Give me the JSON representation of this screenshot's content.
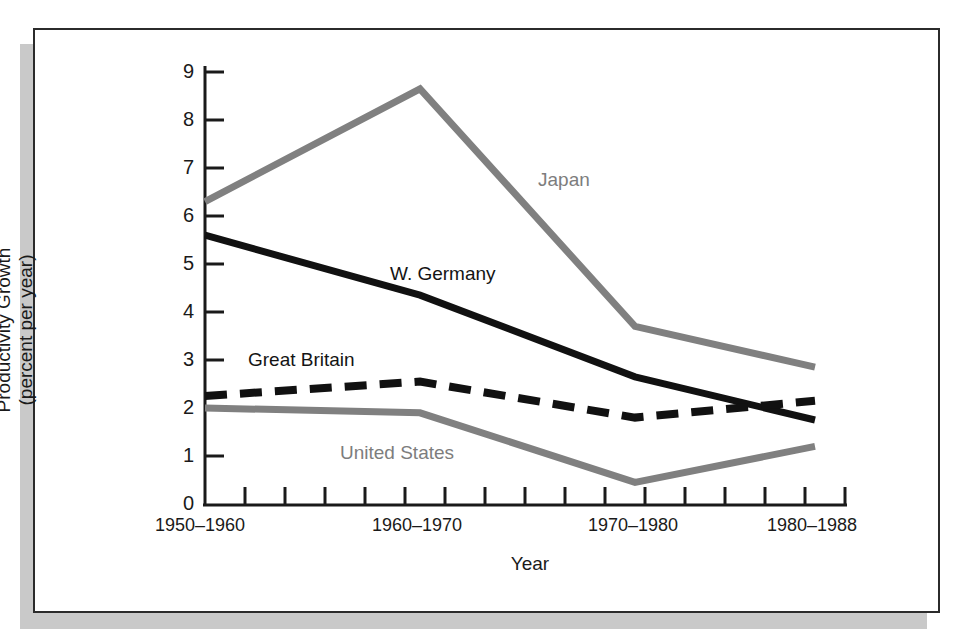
{
  "figure": {
    "frame_border_color": "#2b2b2b",
    "shadow_color": "#c9c9c9",
    "background": "#ffffff"
  },
  "chart_data": {
    "type": "line",
    "title": "",
    "xlabel": "Year",
    "ylabel": "Productivity Growth\n(percent per year)",
    "categories": [
      "1950–1960",
      "1960–1970",
      "1970–1980",
      "1980–1988"
    ],
    "ylim": [
      0,
      9
    ],
    "yticks": [
      0,
      1,
      2,
      3,
      4,
      5,
      6,
      7,
      8,
      9
    ],
    "ytick_labels": [
      "0",
      "1",
      "2",
      "3",
      "4",
      "5",
      "6",
      "7",
      "8",
      "9"
    ],
    "grid": false,
    "legend_position": "inline-annotations",
    "minor_xticks": 16,
    "series": [
      {
        "name": "Japan",
        "values": [
          6.3,
          8.65,
          3.7,
          2.85
        ],
        "color": "#808080",
        "style": "solid",
        "label_color": "#7d7d7d"
      },
      {
        "name": "W. Germany",
        "values": [
          5.6,
          4.35,
          2.65,
          1.75
        ],
        "color": "#111111",
        "style": "solid",
        "label_color": "#141414"
      },
      {
        "name": "Great Britain",
        "values": [
          2.25,
          2.55,
          1.8,
          2.15
        ],
        "color": "#111111",
        "style": "dashed",
        "label_color": "#141414"
      },
      {
        "name": "United States",
        "values": [
          2.0,
          1.9,
          0.45,
          1.2
        ],
        "color": "#808080",
        "style": "solid",
        "label_color": "#7d7d7d"
      }
    ]
  },
  "axis": {
    "y_title": "Productivity Growth\n(percent per year)",
    "x_title": "Year"
  },
  "labels": {
    "japan": "Japan",
    "w_germany": "W. Germany",
    "great_britain": "Great Britain",
    "united_states": "United States"
  },
  "xtick_labels": {
    "t0": "1950–1960",
    "t1": "1960–1970",
    "t2": "1970–1980",
    "t3": "1980–1988"
  },
  "ytick_labels": {
    "y0": "0",
    "y1": "1",
    "y2": "2",
    "y3": "3",
    "y4": "4",
    "y5": "5",
    "y6": "6",
    "y7": "7",
    "y8": "8",
    "y9": "9"
  }
}
